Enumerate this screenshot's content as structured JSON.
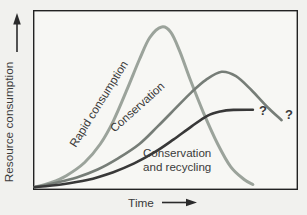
{
  "figure": {
    "background": "#f1f1ee",
    "plot_background": "#f7f7f4",
    "border_color": "#222222",
    "text_color": "#3a3a3a"
  },
  "chart_data": {
    "type": "line",
    "title": "",
    "xlabel": "Time",
    "ylabel": "Resource consumption",
    "xlim": [
      0,
      1
    ],
    "ylim": [
      0,
      1
    ],
    "grid": false,
    "legend": "labels drawn along curves",
    "axes_qualitative": true,
    "series": [
      {
        "name": "Rapid consumption",
        "color": "#9ba39b",
        "stroke_width": 3,
        "points": [
          [
            0,
            0.005
          ],
          [
            0.06,
            0.03
          ],
          [
            0.12,
            0.07
          ],
          [
            0.19,
            0.145
          ],
          [
            0.25,
            0.25
          ],
          [
            0.3,
            0.38
          ],
          [
            0.35,
            0.55
          ],
          [
            0.4,
            0.73
          ],
          [
            0.44,
            0.855
          ],
          [
            0.485,
            0.915
          ],
          [
            0.52,
            0.885
          ],
          [
            0.555,
            0.775
          ],
          [
            0.595,
            0.615
          ],
          [
            0.645,
            0.43
          ],
          [
            0.7,
            0.25
          ],
          [
            0.75,
            0.12
          ],
          [
            0.8,
            0.05
          ],
          [
            0.835,
            0.02
          ]
        ]
      },
      {
        "name": "Conservation",
        "color": "#767d77",
        "stroke_width": 2.6,
        "points": [
          [
            0,
            0.005
          ],
          [
            0.08,
            0.03
          ],
          [
            0.16,
            0.06
          ],
          [
            0.24,
            0.105
          ],
          [
            0.32,
            0.17
          ],
          [
            0.4,
            0.25
          ],
          [
            0.47,
            0.35
          ],
          [
            0.54,
            0.455
          ],
          [
            0.6,
            0.545
          ],
          [
            0.655,
            0.615
          ],
          [
            0.715,
            0.66
          ],
          [
            0.77,
            0.635
          ],
          [
            0.83,
            0.555
          ],
          [
            0.89,
            0.46
          ],
          [
            0.945,
            0.385
          ]
        ]
      },
      {
        "name": "Conservation and recycling",
        "color": "#383838",
        "stroke_width": 2.6,
        "points": [
          [
            0,
            0.005
          ],
          [
            0.1,
            0.02
          ],
          [
            0.2,
            0.045
          ],
          [
            0.3,
            0.09
          ],
          [
            0.38,
            0.14
          ],
          [
            0.46,
            0.205
          ],
          [
            0.53,
            0.275
          ],
          [
            0.6,
            0.35
          ],
          [
            0.66,
            0.41
          ],
          [
            0.71,
            0.435
          ],
          [
            0.76,
            0.444
          ],
          [
            0.835,
            0.445
          ]
        ]
      }
    ],
    "annotations": [
      {
        "text": "?",
        "after_series": "Conservation and recycling"
      },
      {
        "text": "?",
        "after_series": "Conservation"
      }
    ]
  },
  "labels": {
    "rapid": "Rapid consumption",
    "conservation": "Conservation",
    "recycling_line1": "Conservation",
    "recycling_line2": "and recycling"
  }
}
